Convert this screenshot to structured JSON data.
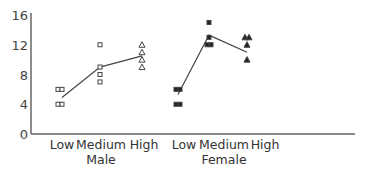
{
  "chart_data": {
    "type": "scatter",
    "title": "",
    "xlabel": "",
    "ylabel": "",
    "ylim": [
      0,
      16
    ],
    "yticks": [
      0,
      4,
      8,
      12,
      16
    ],
    "grid": false,
    "legend": null,
    "groups": [
      {
        "name": "Male",
        "categories": [
          "Low",
          "Medium",
          "High"
        ]
      },
      {
        "name": "Female",
        "categories": [
          "Low",
          "Medium",
          "High"
        ]
      }
    ],
    "categories": [
      "Low",
      "Medium",
      "High",
      "Low",
      "Medium",
      "High"
    ],
    "series": [
      {
        "name": "Male",
        "marker": "open",
        "points": {
          "Low": {
            "marker": "open-square",
            "values": [
              6,
              6,
              4,
              4
            ]
          },
          "Medium": {
            "marker": "open-square",
            "values": [
              12,
              9,
              8,
              7
            ]
          },
          "High": {
            "marker": "open-triangle",
            "values": [
              12,
              11,
              10,
              9
            ]
          }
        },
        "mean_line": [
          4.9,
          9,
          10.5
        ]
      },
      {
        "name": "Female",
        "marker": "filled",
        "points": {
          "Low": {
            "marker": "filled-square",
            "values": [
              6,
              6,
              4,
              4
            ]
          },
          "Medium": {
            "marker": "filled-square",
            "values": [
              15,
              13,
              12,
              12
            ]
          },
          "High": {
            "marker": "filled-triangle",
            "values": [
              13,
              13,
              12,
              10
            ]
          }
        },
        "mean_line": [
          5.3,
          13.3,
          11
        ]
      }
    ]
  },
  "axis": {
    "y_tick_labels": [
      "16",
      "12",
      "8",
      "4",
      "0"
    ],
    "x_category_labels": [
      "Low",
      "Medium",
      "High",
      "Low",
      "Medium",
      "High"
    ],
    "group_labels": [
      "Male",
      "Female"
    ]
  }
}
